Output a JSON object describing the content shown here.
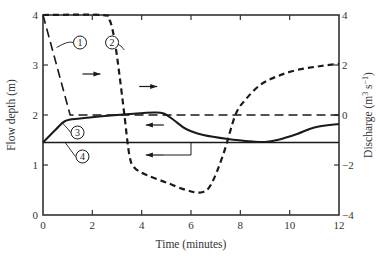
{
  "chart_data": {
    "type": "line",
    "title": "",
    "xlabel": "Time (minutes)",
    "ylabel_left": "Flow depth (m)",
    "ylabel_right": "Discharge (m³ s⁻¹)",
    "xlim": [
      0,
      12
    ],
    "ylim_left": [
      0,
      4
    ],
    "ylim_right": [
      -4,
      4
    ],
    "x_ticks": [
      0,
      2,
      4,
      6,
      8,
      10,
      12
    ],
    "y_left_ticks": [
      0,
      1,
      2,
      3,
      4
    ],
    "y_right_ticks": [
      -4,
      -2,
      0,
      2,
      4
    ],
    "grid": false,
    "legend": "numbered callouts",
    "series": [
      {
        "name": "1",
        "axis": "left",
        "style": "long-dash",
        "x": [
          0,
          1.1,
          12
        ],
        "y": [
          4.0,
          2.0,
          2.0
        ]
      },
      {
        "name": "2",
        "axis": "right",
        "style": "short-dash-bold",
        "x": [
          0,
          2.4,
          2.7,
          2.9,
          3.1,
          3.3,
          3.5,
          3.7,
          4.2,
          5.0,
          5.8,
          6.4,
          6.8,
          7.3,
          7.8,
          8.2,
          8.8,
          9.5,
          10.3,
          11.2,
          12.0
        ],
        "y": [
          4.0,
          4.0,
          3.8,
          3.0,
          1.6,
          0.0,
          -1.6,
          -2.1,
          -2.4,
          -2.7,
          -3.0,
          -3.1,
          -2.8,
          -1.6,
          0.0,
          0.6,
          1.2,
          1.55,
          1.8,
          1.95,
          2.05
        ]
      },
      {
        "name": "3",
        "axis": "left",
        "style": "solid-bold",
        "x": [
          0,
          0.5,
          0.9,
          1.5,
          2.5,
          3.5,
          4.5,
          4.9,
          5.3,
          5.8,
          6.5,
          7.5,
          8.5,
          9.0,
          9.5,
          10.3,
          11.0,
          12.0
        ],
        "y": [
          1.45,
          1.7,
          1.88,
          1.93,
          1.98,
          2.02,
          2.05,
          2.03,
          1.9,
          1.72,
          1.6,
          1.52,
          1.47,
          1.46,
          1.5,
          1.62,
          1.75,
          1.82
        ]
      },
      {
        "name": "4",
        "axis": "left",
        "style": "solid-thin",
        "x": [
          0,
          12
        ],
        "y": [
          1.45,
          1.45
        ]
      }
    ],
    "annotations": [
      {
        "label": "1",
        "type": "callout",
        "x": 1.5,
        "y": 3.45
      },
      {
        "label": "2",
        "type": "callout",
        "x": 2.8,
        "y": 3.45
      },
      {
        "label": "3",
        "type": "callout",
        "x": 1.4,
        "y": 1.65
      },
      {
        "label": "4",
        "type": "callout",
        "x": 1.6,
        "y": 1.17
      },
      {
        "label": "arrow-right",
        "type": "axis-arrow",
        "target": "curve 1 → left axis",
        "x": 1.6,
        "y": 2.82
      },
      {
        "label": "arrow-right",
        "type": "axis-arrow",
        "target": "curve 2 → right axis",
        "x": 3.9,
        "y": 2.57
      },
      {
        "label": "arrow-left",
        "type": "axis-arrow",
        "target": "curve 3 → left axis",
        "x": 4.9,
        "y": 1.8
      },
      {
        "label": "arrow-left",
        "type": "axis-arrow",
        "target": "curve 4 → left axis",
        "x": 4.9,
        "y": 1.2
      }
    ]
  },
  "labels": {
    "xlabel": "Time (minutes)",
    "ylabel_left": "Flow depth (m)",
    "ylabel_right_main": "Discharge (m",
    "ylabel_right_sup3": "3",
    "ylabel_right_mid": " s",
    "ylabel_right_supm1": "−1",
    "ylabel_right_end": ")",
    "x_ticks": [
      "0",
      "2",
      "4",
      "6",
      "8",
      "10",
      "12"
    ],
    "y_left_ticks": [
      "0",
      "1",
      "2",
      "3",
      "4"
    ],
    "y_right_ticks": [
      "−4",
      "−2",
      "0",
      "2",
      "4"
    ],
    "callouts": [
      "1",
      "2",
      "3",
      "4"
    ]
  },
  "colors": {
    "line": "#1a1a1a",
    "axis": "#333333",
    "background": "#ffffff"
  }
}
